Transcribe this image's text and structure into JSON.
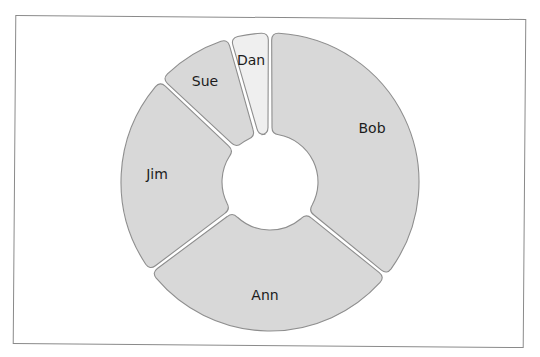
{
  "chart_data": {
    "type": "pie",
    "variant": "donut",
    "title": "",
    "legend": "none",
    "start_angle_deg": 0,
    "direction": "clockwise",
    "categories": [
      "Bob",
      "Ann",
      "Jim",
      "Sue",
      "Dan"
    ],
    "values": [
      35.8,
      28.9,
      22.2,
      8.6,
      4.4
    ],
    "colors": [
      "#d8d8d8",
      "#d8d8d8",
      "#d8d8d8",
      "#d8d8d8",
      "#efefef"
    ],
    "label_positions": [
      [
        372,
        129
      ],
      [
        265,
        296
      ],
      [
        157,
        175
      ],
      [
        205,
        82
      ],
      [
        251,
        61
      ]
    ],
    "geometry": {
      "cx": 270,
      "cy": 182,
      "outer_radius": 149,
      "inner_radius": 48,
      "gap_px": 3.5,
      "corner_radius": 7
    },
    "outline_color": "#8e8e8e",
    "frame_color": "#8a8a8a"
  }
}
